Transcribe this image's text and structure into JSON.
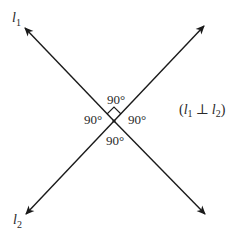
{
  "diagram": {
    "lines": [
      {
        "name": "l1",
        "label_main": "l",
        "label_sub": "1"
      },
      {
        "name": "l2",
        "label_main": "l",
        "label_sub": "2"
      }
    ],
    "angles": {
      "top": "90°",
      "left": "90°",
      "right": "90°",
      "bottom": "90°"
    },
    "relation": {
      "open": "(",
      "l1_main": "l",
      "l1_sub": "1",
      "symbol": "⊥",
      "l2_main": "l",
      "l2_sub": "2",
      "close": ")"
    },
    "colors": {
      "line": "#1a1a1a",
      "text": "#2a2a2a",
      "background": "#ffffff"
    }
  }
}
